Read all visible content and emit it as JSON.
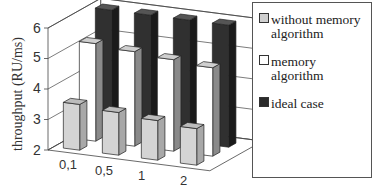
{
  "chart_data": {
    "type": "bar",
    "subtype": "3d-grouped-bar",
    "title": "",
    "xlabel": "",
    "ylabel": "throughput (RU/ms)",
    "ylim": [
      2,
      6
    ],
    "yticks": [
      "2",
      "3",
      "4",
      "5",
      "6"
    ],
    "categories": [
      "0,1",
      "0,5",
      "1",
      "2"
    ],
    "series": [
      {
        "name": "without memory algorithm",
        "color": "#cfcfcf",
        "values": [
          3.5,
          3.4,
          3.3,
          3.2
        ]
      },
      {
        "name": "memory algorithm",
        "color": "#ffffff",
        "values": [
          5.2,
          5.1,
          5.0,
          4.9
        ]
      },
      {
        "name": "ideal case",
        "color": "#2b2b2b",
        "values": [
          6.0,
          6.0,
          6.0,
          6.0
        ]
      }
    ],
    "grid": true,
    "legend_position": "right"
  },
  "legend": {
    "items": [
      {
        "line1": "without memory",
        "line2": "algorithm"
      },
      {
        "line1": "memory",
        "line2": "algorithm"
      },
      {
        "line1": "ideal case",
        "line2": ""
      }
    ]
  }
}
